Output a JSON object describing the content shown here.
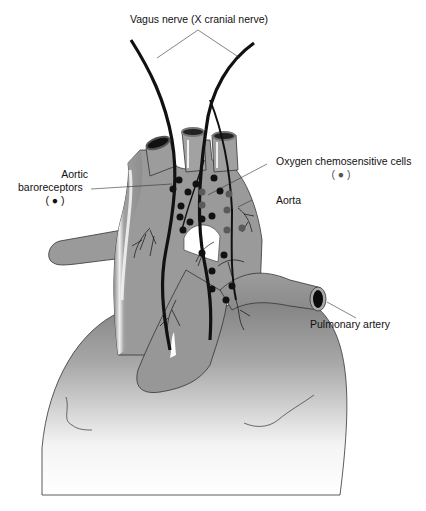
{
  "diagram": {
    "labels": {
      "vagus": "Vagus nerve (X cranial nerve)",
      "baroreceptors_line1": "Aortic",
      "baroreceptors_line2": "baroreceptors",
      "baroreceptors_legend": "( ● )",
      "chemosensitive": "Oxygen chemosensitive cells",
      "chemosensitive_legend": "( ● )",
      "aorta": "Aorta",
      "pulmonary": "Pulmonary artery"
    },
    "legend": [
      {
        "name": "Aortic baroreceptors",
        "symbol": "black-dot",
        "color": "#111111"
      },
      {
        "name": "Oxygen chemosensitive cells",
        "symbol": "gray-dot",
        "color": "#555555"
      }
    ],
    "colors": {
      "vessel": "#9a9a9a",
      "vessel_highlight": "#e6e6e6",
      "heart_top": "#8a8a8a",
      "nerve": "#111111",
      "outline": "#333333"
    }
  }
}
